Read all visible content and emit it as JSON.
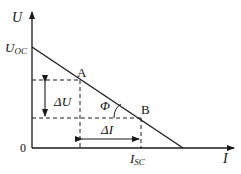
{
  "diagram": {
    "axes": {
      "y_label": "U",
      "x_label": "I",
      "origin_label": "0"
    },
    "intercepts": {
      "y_intercept_main": "U",
      "y_intercept_sub": "OC",
      "x_marker_main": "I",
      "x_marker_sub": "SC"
    },
    "points": [
      {
        "label": "A"
      },
      {
        "label": "B"
      }
    ],
    "annotations": {
      "delta_u": "ΔU",
      "delta_i": "ΔI",
      "angle": "Φ"
    },
    "colors": {
      "line": "#1a1a1a",
      "background": "#ffffff"
    }
  }
}
